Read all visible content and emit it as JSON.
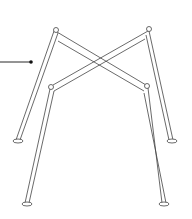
{
  "diagram": {
    "colors": {
      "stroke": "#444444",
      "leader": "#111111",
      "background": "#ffffff"
    },
    "leader": {
      "x1": 0,
      "y1": 62,
      "x2": 31,
      "y2": 62
    }
  }
}
